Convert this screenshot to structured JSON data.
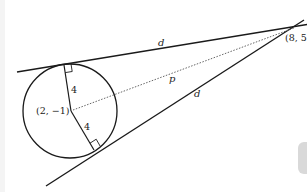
{
  "diagram": {
    "type": "circle-tangent-lines",
    "center_label": "(2, −1)",
    "external_point_label": "(8, 5)",
    "radius_label_upper": "4",
    "radius_label_lower": "4",
    "tangent_label_upper": "d",
    "tangent_label_lower": "d",
    "distance_label": "p",
    "colors": {
      "line": "#1a1a1a",
      "dotted": "#555555",
      "background": "#ffffff"
    }
  }
}
